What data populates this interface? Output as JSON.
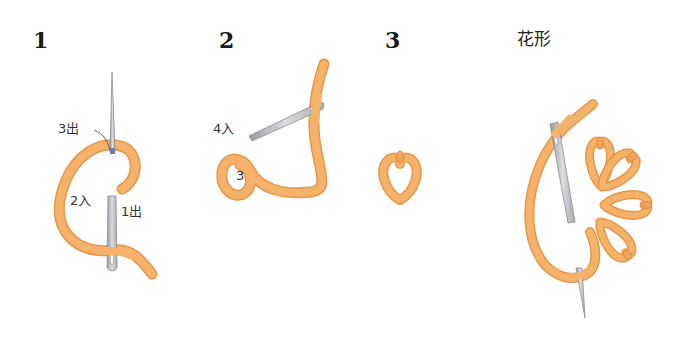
{
  "diagram": {
    "type": "embroidery-stitch-steps",
    "colors": {
      "thread": "#f5b26b",
      "thread_shadow": "#e8964a",
      "thread_highlight": "#fbd3a2",
      "needle": "#c9c9cc",
      "needle_edge": "#8d8d92",
      "text": "#222222"
    },
    "steps": [
      {
        "number": "1",
        "labels": [
          {
            "text": "3出"
          },
          {
            "text": "2入"
          },
          {
            "text": "1出"
          }
        ]
      },
      {
        "number": "2",
        "labels": [
          {
            "text": "4入"
          },
          {
            "text": "3"
          }
        ]
      },
      {
        "number": "3",
        "labels": []
      },
      {
        "title": "花形",
        "labels": []
      }
    ]
  }
}
